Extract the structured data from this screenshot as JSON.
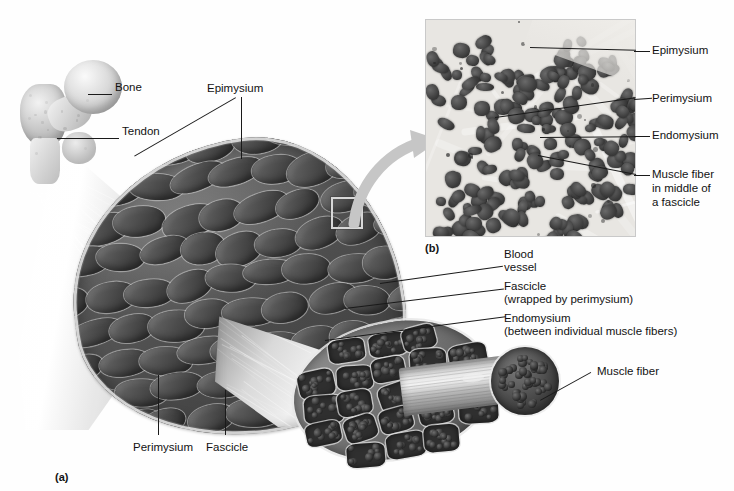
{
  "figure": {
    "panel_a_caption": "(a)",
    "panel_b_caption": "(b)"
  },
  "panel_a": {
    "name": "skeletal-muscle-gross-anatomy",
    "labels": [
      {
        "id": "bone",
        "text": "Bone",
        "x": 115,
        "y": 88,
        "align": "left"
      },
      {
        "id": "epimysium",
        "text": "Epimysium",
        "x": 207,
        "y": 89,
        "align": "left"
      },
      {
        "id": "tendon",
        "text": "Tendon",
        "x": 122,
        "y": 132,
        "align": "left"
      },
      {
        "id": "perimysium",
        "text": "Perimysium",
        "x": 133,
        "y": 443,
        "align": "left"
      },
      {
        "id": "fascicle",
        "text": "Fascicle",
        "x": 206,
        "y": 443,
        "align": "left"
      }
    ],
    "right_labels": [
      {
        "id": "blood-vessel",
        "line1": "Blood",
        "line2": "vessel",
        "x": 504,
        "y": 253
      },
      {
        "id": "fascicle-wrapped",
        "line1": "Fascicle",
        "line2": "(wrapped by perimysium)",
        "x": 504,
        "y": 285
      },
      {
        "id": "endomysium-between",
        "line1": "Endomysium",
        "line2": "(between individual muscle fibers)",
        "x": 504,
        "y": 317
      },
      {
        "id": "muscle-fiber",
        "line1": "Muscle fiber",
        "line2": "",
        "x": 597,
        "y": 370
      }
    ]
  },
  "panel_b": {
    "name": "muscle-cross-section-micrograph",
    "labels": [
      {
        "id": "epimysium",
        "text": "Epimysium",
        "x": 652,
        "y": 45
      },
      {
        "id": "perimysium",
        "text": "Perimysium",
        "x": 652,
        "y": 93
      },
      {
        "id": "endomysium",
        "text": "Endomysium",
        "x": 652,
        "y": 130
      },
      {
        "id": "muscle-fiber",
        "text": "Muscle fiber",
        "x": 652,
        "y": 169
      }
    ],
    "muscle_fiber_extra": [
      "in middle of",
      "a fascicle"
    ]
  },
  "colors": {
    "background": "#fefefe",
    "label_text": "#121212",
    "leader_line": "#1a1a1a",
    "muscle_dark": "#4a4a4a",
    "muscle_mid": "#6f6f6f",
    "connective_tissue": "#e8e8e8",
    "bone": "#d2d2d2",
    "highlight_box": "#d8d8d8",
    "zoom_arrow": "#c0c0c0"
  }
}
